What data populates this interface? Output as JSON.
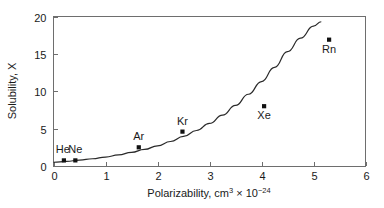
{
  "chart_data": {
    "type": "scatter",
    "title": "",
    "xlabel": "Polarizability, cm³ × 10⁻²⁴",
    "xlabel_parts": {
      "base": "Polarizability, cm",
      "sup1": "3",
      "times": "× 10",
      "sup2": "−24"
    },
    "ylabel": "Solubility, X",
    "xlim": [
      0,
      6
    ],
    "ylim": [
      0,
      20
    ],
    "xticks": [
      "0",
      "1",
      "2",
      "3",
      "4",
      "5",
      "6"
    ],
    "yticks": [
      "0",
      "5",
      "10",
      "15",
      "20"
    ],
    "xtick_values": [
      0,
      1,
      2,
      3,
      4,
      5,
      6
    ],
    "ytick_values": [
      0,
      5,
      10,
      15,
      20
    ],
    "grid": false,
    "legend": false,
    "marker_style": "filled-square",
    "points": [
      {
        "label": "He",
        "x": 0.2,
        "y": 0.75,
        "label_pos": "above-left"
      },
      {
        "label": "Ne",
        "x": 0.42,
        "y": 0.75,
        "label_pos": "above"
      },
      {
        "label": "Ar",
        "x": 1.64,
        "y": 2.5,
        "label_pos": "above"
      },
      {
        "label": "Kr",
        "x": 2.48,
        "y": 4.6,
        "label_pos": "above"
      },
      {
        "label": "Xe",
        "x": 4.05,
        "y": 8.0,
        "label_pos": "below"
      },
      {
        "label": "Rn",
        "x": 5.3,
        "y": 16.9,
        "label_pos": "below"
      }
    ],
    "fit_curve": {
      "name": "trend",
      "x": [
        0.0,
        0.25,
        0.5,
        0.75,
        1.0,
        1.25,
        1.5,
        1.75,
        2.0,
        2.25,
        2.5,
        2.75,
        3.0,
        3.25,
        3.5,
        3.75,
        4.0,
        4.25,
        4.5,
        4.75,
        5.0,
        5.15
      ],
      "y": [
        0.5,
        0.62,
        0.78,
        0.97,
        1.2,
        1.48,
        1.82,
        2.22,
        2.7,
        3.28,
        3.95,
        4.75,
        5.7,
        6.8,
        8.1,
        9.6,
        11.3,
        13.2,
        15.3,
        17.1,
        18.7,
        19.3
      ]
    },
    "colors": {
      "marker": "#111111",
      "curve": "#2a2a2a",
      "frame": "#6e6e6e",
      "text": "#1a1a1a",
      "background": "#ffffff"
    }
  }
}
